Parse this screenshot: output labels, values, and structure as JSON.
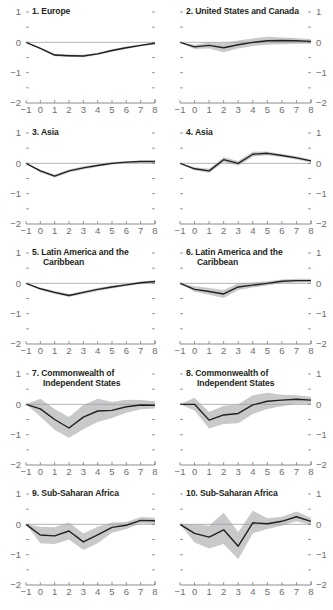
{
  "figure": {
    "band_color": "#c8c9cb",
    "line_color": "#231f20",
    "zero_line_color": "#9d9fa2",
    "axis_color": "#6d6e71",
    "tick_label_color": "#6d6e71"
  },
  "panels": [
    {
      "id": 1,
      "title_line1": "1. Europe",
      "title_line2": "",
      "y_axis_side": "left"
    },
    {
      "id": 2,
      "title_line1": "2. United States and Canada",
      "title_line2": "",
      "y_axis_side": "right"
    },
    {
      "id": 3,
      "title_line1": "3. Asia",
      "title_line2": "",
      "y_axis_side": "left"
    },
    {
      "id": 4,
      "title_line1": "4. Asia",
      "title_line2": "",
      "y_axis_side": "right"
    },
    {
      "id": 5,
      "title_line1": "5. Latin America and the",
      "title_line2": "Caribbean",
      "y_axis_side": "left"
    },
    {
      "id": 6,
      "title_line1": "6. Latin America and the",
      "title_line2": "Caribbean",
      "y_axis_side": "right"
    },
    {
      "id": 7,
      "title_line1": "7. Commonwealth of",
      "title_line2": "Independent States",
      "y_axis_side": "left"
    },
    {
      "id": 8,
      "title_line1": "8. Commonwealth of",
      "title_line2": "Independent States",
      "y_axis_side": "right"
    },
    {
      "id": 9,
      "title_line1": "9. Sub-Saharan Africa",
      "title_line2": "",
      "y_axis_side": "left"
    },
    {
      "id": 10,
      "title_line1": "10. Sub-Saharan Africa",
      "title_line2": "",
      "y_axis_side": "right"
    }
  ],
  "chart_data": [
    {
      "type": "line",
      "title": "1. Europe",
      "x": [
        -1,
        0,
        1,
        2,
        3,
        4,
        5,
        6,
        7,
        8
      ],
      "ylim": [
        -2,
        1
      ],
      "yticks": [
        1,
        0,
        -1,
        -2
      ],
      "xticks": [
        -1,
        0,
        1,
        2,
        3,
        4,
        5,
        6,
        7,
        8
      ],
      "series": [
        {
          "name": "estimate",
          "values": [
            0,
            -0.2,
            -0.42,
            -0.44,
            -0.45,
            -0.38,
            -0.27,
            -0.18,
            -0.1,
            -0.03
          ]
        }
      ],
      "band": {
        "lower": [
          0,
          -0.23,
          -0.46,
          -0.48,
          -0.49,
          -0.42,
          -0.31,
          -0.22,
          -0.13,
          -0.06
        ],
        "upper": [
          0,
          -0.17,
          -0.38,
          -0.4,
          -0.41,
          -0.34,
          -0.23,
          -0.14,
          -0.07,
          0.0
        ]
      }
    },
    {
      "type": "line",
      "title": "2. United States and Canada",
      "x": [
        -1,
        0,
        1,
        2,
        3,
        4,
        5,
        6,
        7,
        8
      ],
      "ylim": [
        -2,
        1
      ],
      "yticks": [
        1,
        0,
        -1,
        -2
      ],
      "xticks": [
        -1,
        0,
        1,
        2,
        3,
        4,
        5,
        6,
        7,
        8
      ],
      "series": [
        {
          "name": "estimate",
          "values": [
            0,
            -0.15,
            -0.1,
            -0.18,
            -0.08,
            0.0,
            0.05,
            0.06,
            0.05,
            0.03
          ]
        }
      ],
      "band": {
        "lower": [
          0,
          -0.22,
          -0.2,
          -0.33,
          -0.2,
          -0.12,
          -0.08,
          -0.06,
          -0.05,
          -0.05
        ],
        "upper": [
          0,
          -0.08,
          0.0,
          -0.03,
          0.06,
          0.13,
          0.18,
          0.16,
          0.14,
          0.1
        ]
      }
    },
    {
      "type": "line",
      "title": "3. Asia",
      "x": [
        -1,
        0,
        1,
        2,
        3,
        4,
        5,
        6,
        7,
        8
      ],
      "ylim": [
        -2,
        1
      ],
      "yticks": [
        1,
        0,
        -1,
        -2
      ],
      "xticks": [
        -1,
        0,
        1,
        2,
        3,
        4,
        5,
        6,
        7,
        8
      ],
      "series": [
        {
          "name": "estimate",
          "values": [
            0,
            -0.25,
            -0.42,
            -0.25,
            -0.15,
            -0.07,
            0.0,
            0.04,
            0.06,
            0.06
          ]
        }
      ],
      "band": {
        "lower": [
          0,
          -0.29,
          -0.47,
          -0.3,
          -0.2,
          -0.11,
          -0.04,
          0.01,
          0.03,
          0.03
        ],
        "upper": [
          0,
          -0.2,
          -0.37,
          -0.2,
          -0.1,
          -0.03,
          0.04,
          0.07,
          0.09,
          0.09
        ]
      }
    },
    {
      "type": "line",
      "title": "4. Asia",
      "x": [
        -1,
        0,
        1,
        2,
        3,
        4,
        5,
        6,
        7,
        8
      ],
      "ylim": [
        -2,
        1
      ],
      "yticks": [
        1,
        0,
        -1,
        -2
      ],
      "xticks": [
        -1,
        0,
        1,
        2,
        3,
        4,
        5,
        6,
        7,
        8
      ],
      "series": [
        {
          "name": "estimate",
          "values": [
            0,
            -0.18,
            -0.25,
            0.12,
            0.0,
            0.3,
            0.33,
            0.26,
            0.18,
            0.08
          ]
        }
      ],
      "band": {
        "lower": [
          0,
          -0.23,
          -0.32,
          0.04,
          -0.08,
          0.22,
          0.27,
          0.21,
          0.13,
          0.03
        ],
        "upper": [
          0,
          -0.13,
          -0.18,
          0.2,
          0.08,
          0.38,
          0.39,
          0.31,
          0.23,
          0.13
        ]
      }
    },
    {
      "type": "line",
      "title": "5. Latin America and the Caribbean",
      "x": [
        -1,
        0,
        1,
        2,
        3,
        4,
        5,
        6,
        7,
        8
      ],
      "ylim": [
        -2,
        1
      ],
      "yticks": [
        1,
        0,
        -1,
        -2
      ],
      "xticks": [
        -1,
        0,
        1,
        2,
        3,
        4,
        5,
        6,
        7,
        8
      ],
      "series": [
        {
          "name": "estimate",
          "values": [
            0,
            -0.18,
            -0.3,
            -0.4,
            -0.3,
            -0.2,
            -0.12,
            -0.05,
            0.02,
            0.06
          ]
        }
      ],
      "band": {
        "lower": [
          0,
          -0.22,
          -0.35,
          -0.45,
          -0.35,
          -0.25,
          -0.17,
          -0.09,
          -0.02,
          0.02
        ],
        "upper": [
          0,
          -0.14,
          -0.25,
          -0.35,
          -0.25,
          -0.15,
          -0.07,
          -0.01,
          0.06,
          0.1
        ]
      }
    },
    {
      "type": "line",
      "title": "6. Latin America and the Caribbean",
      "x": [
        -1,
        0,
        1,
        2,
        3,
        4,
        5,
        6,
        7,
        8
      ],
      "ylim": [
        -2,
        1
      ],
      "yticks": [
        1,
        0,
        -1,
        -2
      ],
      "xticks": [
        -1,
        0,
        1,
        2,
        3,
        4,
        5,
        6,
        7,
        8
      ],
      "series": [
        {
          "name": "estimate",
          "values": [
            0,
            -0.2,
            -0.27,
            -0.35,
            -0.12,
            -0.06,
            0.0,
            0.07,
            0.09,
            0.09
          ]
        }
      ],
      "band": {
        "lower": [
          0,
          -0.28,
          -0.38,
          -0.48,
          -0.22,
          -0.14,
          -0.07,
          0.01,
          0.03,
          0.04
        ],
        "upper": [
          0,
          -0.1,
          -0.15,
          -0.22,
          0.0,
          0.03,
          0.07,
          0.13,
          0.15,
          0.15
        ]
      }
    },
    {
      "type": "line",
      "title": "7. Commonwealth of Independent States",
      "x": [
        -1,
        0,
        1,
        2,
        3,
        4,
        5,
        6,
        7,
        8
      ],
      "ylim": [
        -2,
        1
      ],
      "yticks": [
        1,
        0,
        -1,
        -2
      ],
      "xticks": [
        -1,
        0,
        1,
        2,
        3,
        4,
        5,
        6,
        7,
        8
      ],
      "series": [
        {
          "name": "estimate",
          "values": [
            0,
            -0.15,
            -0.5,
            -0.78,
            -0.42,
            -0.22,
            -0.2,
            -0.08,
            -0.02,
            -0.03
          ]
        }
      ],
      "band": {
        "lower": [
          0,
          -0.4,
          -0.85,
          -1.1,
          -0.82,
          -0.58,
          -0.45,
          -0.28,
          -0.16,
          -0.14
        ],
        "upper": [
          0,
          0.18,
          -0.15,
          -0.42,
          -0.02,
          0.18,
          0.08,
          0.15,
          0.14,
          0.1
        ]
      }
    },
    {
      "type": "line",
      "title": "8. Commonwealth of Independent States",
      "x": [
        -1,
        0,
        1,
        2,
        3,
        4,
        5,
        6,
        7,
        8
      ],
      "ylim": [
        -2,
        1
      ],
      "yticks": [
        1,
        0,
        -1,
        -2
      ],
      "xticks": [
        -1,
        0,
        1,
        2,
        3,
        4,
        5,
        6,
        7,
        8
      ],
      "series": [
        {
          "name": "estimate",
          "values": [
            0,
            0.0,
            -0.52,
            -0.35,
            -0.3,
            -0.02,
            0.1,
            0.14,
            0.17,
            0.14
          ]
        }
      ],
      "band": {
        "lower": [
          0,
          -0.2,
          -0.8,
          -0.65,
          -0.62,
          -0.32,
          -0.15,
          -0.06,
          0.02,
          0.02
        ],
        "upper": [
          0,
          0.22,
          -0.25,
          -0.05,
          0.0,
          0.3,
          0.38,
          0.32,
          0.3,
          0.25
        ]
      }
    },
    {
      "type": "line",
      "title": "9. Sub-Saharan Africa",
      "x": [
        -1,
        0,
        1,
        2,
        3,
        4,
        5,
        6,
        7,
        8
      ],
      "ylim": [
        -2,
        1
      ],
      "yticks": [
        1,
        0,
        -1,
        -2
      ],
      "xticks": [
        -1,
        0,
        1,
        2,
        3,
        4,
        5,
        6,
        7,
        8
      ],
      "series": [
        {
          "name": "estimate",
          "values": [
            0,
            -0.35,
            -0.38,
            -0.22,
            -0.58,
            -0.35,
            -0.1,
            -0.03,
            0.13,
            0.12
          ]
        }
      ],
      "band": {
        "lower": [
          0,
          -0.62,
          -0.65,
          -0.5,
          -0.85,
          -0.62,
          -0.28,
          -0.15,
          0.03,
          0.02
        ],
        "upper": [
          0,
          -0.08,
          -0.1,
          0.06,
          -0.3,
          -0.08,
          0.06,
          0.08,
          0.24,
          0.22
        ]
      }
    },
    {
      "type": "line",
      "title": "10. Sub-Saharan Africa",
      "x": [
        -1,
        0,
        1,
        2,
        3,
        4,
        5,
        6,
        7,
        8
      ],
      "ylim": [
        -2,
        1
      ],
      "yticks": [
        1,
        0,
        -1,
        -2
      ],
      "xticks": [
        -1,
        0,
        1,
        2,
        3,
        4,
        5,
        6,
        7,
        8
      ],
      "series": [
        {
          "name": "estimate",
          "values": [
            0,
            -0.3,
            -0.42,
            -0.18,
            -0.72,
            0.05,
            0.02,
            0.1,
            0.25,
            0.1
          ]
        }
      ],
      "band": {
        "lower": [
          0,
          -0.6,
          -0.8,
          -0.65,
          -1.15,
          -0.3,
          -0.15,
          -0.05,
          0.1,
          -0.02
        ],
        "upper": [
          0,
          0.0,
          -0.05,
          0.38,
          -0.25,
          0.45,
          0.2,
          0.25,
          0.42,
          0.22
        ]
      }
    }
  ]
}
